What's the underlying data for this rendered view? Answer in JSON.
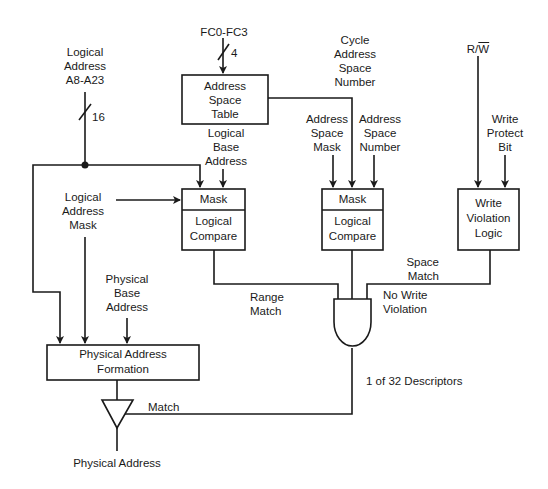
{
  "diagram": {
    "title": "",
    "colors": {
      "line": "#1a1a1a",
      "background": "#ffffff"
    },
    "inputs": {
      "logical_address": [
        "Logical",
        "Address",
        "A8-A23"
      ],
      "logical_address_bus_width": "16",
      "fc": "FC0-FC3",
      "fc_bus_width": "4",
      "cycle_address_space_number": [
        "Cycle",
        "Address",
        "Space",
        "Number"
      ],
      "rw": "R/W",
      "rw_overbar": "W",
      "rw_prefix": "R/",
      "logical_address_mask": [
        "Logical",
        "Address",
        "Mask"
      ],
      "logical_base_address": [
        "Logical",
        "Base",
        "Address"
      ],
      "address_space_mask": [
        "Address",
        "Space",
        "Mask"
      ],
      "address_space_number": [
        "Address",
        "Space",
        "Number"
      ],
      "write_protect_bit": [
        "Write",
        "Protect",
        "Bit"
      ],
      "physical_base_address": [
        "Physical",
        "Base",
        "Address"
      ]
    },
    "blocks": {
      "address_space_table": [
        "Address",
        "Space",
        "Table"
      ],
      "left_mask": "Mask",
      "left_compare": [
        "Logical",
        "Compare"
      ],
      "mid_mask": "Mask",
      "mid_compare": [
        "Logical",
        "Compare"
      ],
      "write_violation": [
        "Write",
        "Violation",
        "Logic"
      ],
      "physical_address_formation": [
        "Physical Address",
        "Formation"
      ]
    },
    "signals": {
      "range_match": [
        "Range",
        "Match"
      ],
      "space_match": [
        "Space",
        "Match"
      ],
      "no_write_violation": [
        "No Write",
        "Violation"
      ],
      "match": "Match",
      "descriptors": "1 of 32 Descriptors",
      "physical_address": "Physical Address"
    }
  }
}
